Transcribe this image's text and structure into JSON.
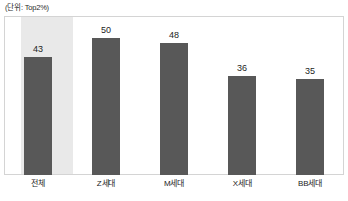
{
  "unit_note": "(단위: Top2%)",
  "colors": {
    "bar": "#585858",
    "highlight_band": "#e9e9e9",
    "frame_border": "#d4d4d4",
    "text": "#1d1d1d",
    "background": "#ffffff"
  },
  "chart_data": {
    "type": "bar",
    "title": "",
    "subtitle": "",
    "xlabel": "",
    "ylabel": "",
    "unit_label": "(단위: Top2%)",
    "categories": [
      "전체",
      "Z세대",
      "M세대",
      "X세대",
      "BB세대"
    ],
    "values": [
      43,
      50,
      48,
      36,
      35
    ],
    "value_labels": [
      "43",
      "50",
      "48",
      "36",
      "35"
    ],
    "highlighted_category": "전체",
    "ylim": [
      0,
      58
    ],
    "grid": false,
    "legend": null,
    "legend_position": "none",
    "axis_tick_labels": {
      "x": [
        "전체",
        "Z세대",
        "M세대",
        "X세대",
        "BB세대"
      ],
      "y": []
    }
  }
}
